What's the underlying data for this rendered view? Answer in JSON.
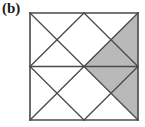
{
  "figure": {
    "panel_label": "(b)",
    "caption_visible": false,
    "background_color": "#ffffff"
  },
  "colors": {
    "line": "#4a4a4a",
    "frame": "#4a4a4a",
    "shade_fill": "#b9b9b9",
    "unshaded_fill": "#ffffff",
    "label_text": "#1a1a1a"
  },
  "geometry": {
    "square": {
      "x": 30,
      "y": 13,
      "width": 108,
      "height": 107
    },
    "midline_y": 66.5,
    "cell_width": 54,
    "cell_height": 53.5,
    "frame_stroke_width": 1.6,
    "line_stroke_width": 1.3
  },
  "chart_data": {
    "type": "diagram",
    "title": "(b)",
    "quadrants": [
      {
        "id": "top-left",
        "col": 0,
        "row": 0,
        "x": 30,
        "y": 13,
        "w": 54,
        "h": 53.5,
        "triangles": {
          "top": "white",
          "right": "white",
          "bottom": "white",
          "left": "white"
        }
      },
      {
        "id": "top-right",
        "col": 1,
        "row": 0,
        "x": 84,
        "y": 13,
        "w": 54,
        "h": 53.5,
        "triangles": {
          "top": "white",
          "right": "shaded",
          "bottom": "shaded",
          "left": "white"
        }
      },
      {
        "id": "bottom-left",
        "col": 0,
        "row": 1,
        "x": 30,
        "y": 66.5,
        "w": 54,
        "h": 53.5,
        "triangles": {
          "top": "white",
          "right": "white",
          "bottom": "white",
          "left": "white"
        }
      },
      {
        "id": "bottom-right",
        "col": 1,
        "row": 1,
        "x": 84,
        "y": 66.5,
        "w": 54,
        "h": 53.5,
        "triangles": {
          "top": "shaded",
          "right": "shaded",
          "bottom": "white",
          "left": "white"
        }
      }
    ],
    "shaded_triangle_count": 4,
    "total_triangle_count": 16,
    "shaded_fraction": "4/16",
    "lines": [
      {
        "name": "frame-top",
        "x1": 30,
        "y1": 13,
        "x2": 138,
        "y2": 13
      },
      {
        "name": "frame-right",
        "x1": 138,
        "y1": 13,
        "x2": 138,
        "y2": 120
      },
      {
        "name": "frame-bottom",
        "x1": 30,
        "y1": 120,
        "x2": 138,
        "y2": 120
      },
      {
        "name": "frame-left",
        "x1": 30,
        "y1": 13,
        "x2": 30,
        "y2": 120
      },
      {
        "name": "horizontal-midline",
        "x1": 30,
        "y1": 66.5,
        "x2": 138,
        "y2": 66.5
      },
      {
        "name": "tl-diag-down",
        "x1": 30,
        "y1": 13,
        "x2": 84,
        "y2": 66.5
      },
      {
        "name": "tl-diag-up",
        "x1": 30,
        "y1": 66.5,
        "x2": 84,
        "y2": 13
      },
      {
        "name": "tr-diag-down",
        "x1": 84,
        "y1": 13,
        "x2": 138,
        "y2": 66.5
      },
      {
        "name": "tr-diag-up",
        "x1": 84,
        "y1": 66.5,
        "x2": 138,
        "y2": 13
      },
      {
        "name": "bl-diag-down",
        "x1": 30,
        "y1": 66.5,
        "x2": 84,
        "y2": 120
      },
      {
        "name": "bl-diag-up",
        "x1": 30,
        "y1": 120,
        "x2": 84,
        "y2": 66.5
      },
      {
        "name": "br-diag-down",
        "x1": 84,
        "y1": 66.5,
        "x2": 138,
        "y2": 120
      },
      {
        "name": "br-diag-up",
        "x1": 84,
        "y1": 120,
        "x2": 138,
        "y2": 66.5
      }
    ],
    "shaded_polygons": [
      {
        "name": "tr-right-triangle",
        "points": "138,13 138,66.5 111,39.75"
      },
      {
        "name": "tr-bottom-triangle",
        "points": "84,66.5 138,66.5 111,39.75"
      },
      {
        "name": "br-top-triangle",
        "points": "84,66.5 138,66.5 111,93.25"
      },
      {
        "name": "br-right-triangle",
        "points": "138,66.5 138,120 111,93.25"
      }
    ]
  }
}
